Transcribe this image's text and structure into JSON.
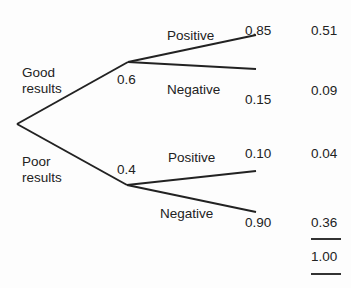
{
  "diagram": {
    "type": "probability-tree",
    "root": {
      "branches": [
        {
          "label": "Good results",
          "label_lines": [
            "Good",
            "results"
          ],
          "probability": "0.6",
          "branches": [
            {
              "label": "Positive",
              "probability": "0.85",
              "joint": "0.51"
            },
            {
              "label": "Negative",
              "probability": "0.15",
              "joint": "0.09"
            }
          ]
        },
        {
          "label": "Poor results",
          "label_lines": [
            "Poor",
            "results"
          ],
          "probability": "0.4",
          "branches": [
            {
              "label": "Positive",
              "probability": "0.10",
              "joint": "0.04"
            },
            {
              "label": "Negative",
              "probability": "0.90",
              "joint": "0.36"
            }
          ]
        }
      ]
    },
    "total": "1.00",
    "line_color": "#222222"
  }
}
